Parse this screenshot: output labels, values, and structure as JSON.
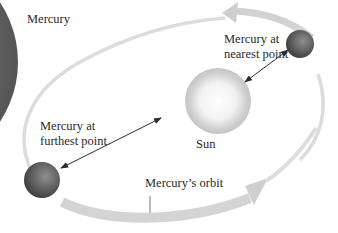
{
  "diagram": {
    "title_label": "Mercury",
    "nearest_label": {
      "line1": "Mercury at",
      "line2": "nearest point"
    },
    "furthest_label": {
      "line1": "Mercury at",
      "line2": "furthest point"
    },
    "sun_label": "Sun",
    "orbit_label": "Mercury’s orbit",
    "colors": {
      "planet_edge": "#6a6a6a",
      "orbit_band": "#d4d4d4",
      "orbit_thin": "#dcdcdc",
      "mercury": "#5a5a5a",
      "sun_core": "#ffffff",
      "sun_edge": "#bdbdbd",
      "arrow": "#2b2b2b",
      "text": "#2a2a2a"
    }
  }
}
